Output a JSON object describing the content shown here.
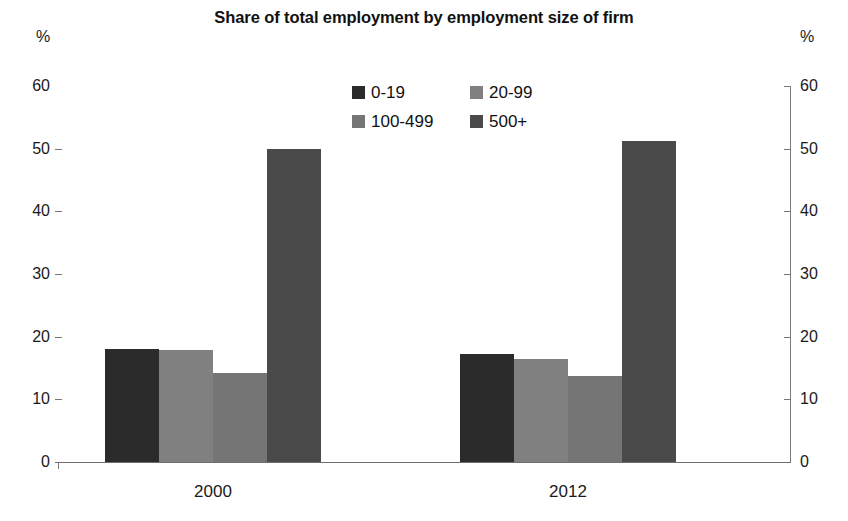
{
  "chart_data": {
    "type": "bar",
    "title": "Share of total employment by employment size of firm",
    "xlabel": "",
    "ylabel": "%",
    "ylabel_right": "%",
    "ylim": [
      0,
      60
    ],
    "yticks": [
      0,
      10,
      20,
      30,
      40,
      50,
      60
    ],
    "grid": false,
    "legend_position": "top-center",
    "categories": [
      "2000",
      "2012"
    ],
    "series": [
      {
        "name": "0-19",
        "values": [
          18.0,
          17.3
        ],
        "color": "#2b2b2b"
      },
      {
        "name": "20-99",
        "values": [
          17.8,
          16.5
        ],
        "color": "#808080"
      },
      {
        "name": "100-499",
        "values": [
          14.2,
          13.8
        ],
        "color": "#757575"
      },
      {
        "name": "500+",
        "values": [
          50.0,
          51.2
        ],
        "color": "#4a4a4a"
      }
    ]
  },
  "axis": {
    "unit_left": "%",
    "unit_right": "%",
    "tick_labels": [
      "60",
      "50",
      "40",
      "30",
      "20",
      "10",
      "0"
    ]
  },
  "legend": {
    "items": [
      {
        "label": "0-19",
        "color": "#2b2b2b"
      },
      {
        "label": "20-99",
        "color": "#808080"
      },
      {
        "label": "100-499",
        "color": "#757575"
      },
      {
        "label": "500+",
        "color": "#4a4a4a"
      }
    ]
  }
}
